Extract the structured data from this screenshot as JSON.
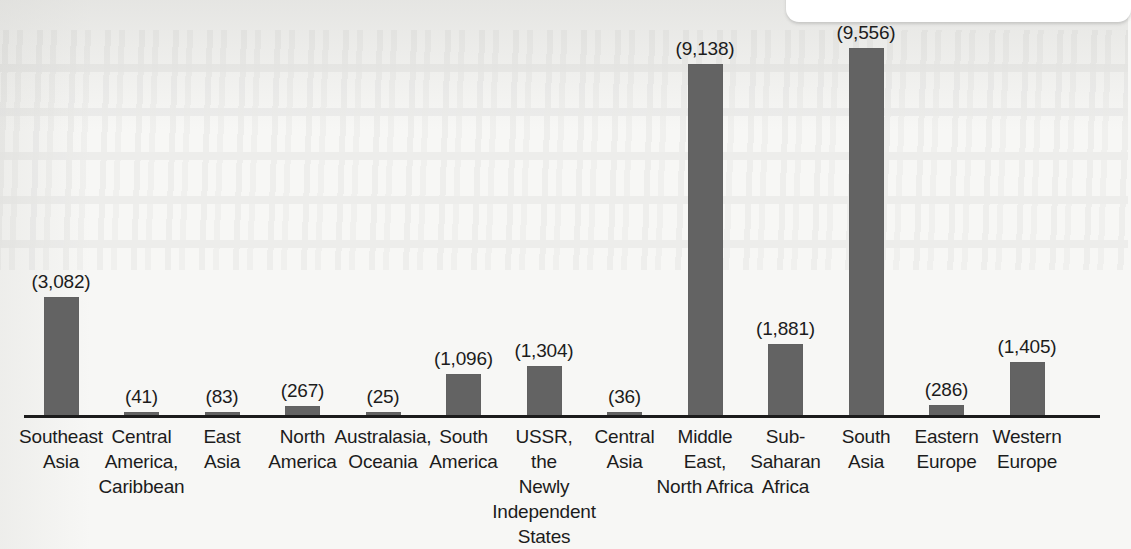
{
  "chart_data": {
    "type": "bar",
    "title": "",
    "subtitle": "",
    "xlabel": "",
    "ylabel": "",
    "grid": false,
    "legend": "none",
    "axis_range": [
      0,
      9556
    ],
    "label_format": "(#,###)",
    "categories": [
      "Southeast Asia",
      "Central America, Caribbean",
      "East Asia",
      "North America",
      "Australasia, Oceania",
      "South America",
      "USSR, the Newly Independent States",
      "Central Asia",
      "Middle East, North Africa",
      "Sub-Saharan Africa",
      "South Asia",
      "Eastern Europe",
      "Western Europe"
    ],
    "category_lines": [
      [
        "Southeast",
        "Asia"
      ],
      [
        "Central",
        "America,",
        "Caribbean"
      ],
      [
        "East",
        "Asia"
      ],
      [
        "North",
        "America"
      ],
      [
        "Australasia,",
        "Oceania"
      ],
      [
        "South",
        "America"
      ],
      [
        "USSR,",
        "the",
        "Newly",
        "Independent",
        "States"
      ],
      [
        "Central",
        "Asia"
      ],
      [
        "Middle",
        "East,",
        "North Africa"
      ],
      [
        "Sub-",
        "Saharan",
        "Africa"
      ],
      [
        "South",
        "Asia"
      ],
      [
        "Eastern",
        "Europe"
      ],
      [
        "Western",
        "Europe"
      ]
    ],
    "values": [
      3082,
      41,
      83,
      267,
      25,
      1096,
      1304,
      36,
      9138,
      1881,
      9556,
      286,
      1405
    ],
    "value_labels": [
      "(3,082)",
      "(41)",
      "(83)",
      "(267)",
      "(25)",
      "(1,096)",
      "(1,304)",
      "(36)",
      "(9,138)",
      "(1,881)",
      "(9,556)",
      "(286)",
      "(1,405)"
    ]
  },
  "colors": {
    "bar_fill": "#636363",
    "axis": "#1c1c1c",
    "text": "#1c1c1c",
    "background": "#f7f7f5",
    "overlay_panel": "#ffffff"
  }
}
